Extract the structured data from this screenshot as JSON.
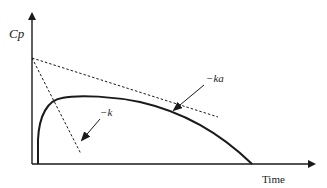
{
  "diagram": {
    "type": "pharmacokinetic concentration-time curve",
    "y_axis_label": "Cp",
    "x_axis_label": "Time",
    "annotations": [
      {
        "id": "ka",
        "label": "−ka",
        "points_to": "terminal elimination slope of curve"
      },
      {
        "id": "k",
        "label": "−k",
        "points_to": "steep dashed line"
      }
    ],
    "lines": [
      {
        "id": "curve",
        "style": "solid",
        "description": "rise then decay concentration curve"
      },
      {
        "id": "dashed-shallow",
        "style": "dashed",
        "description": "extrapolated terminal line from y-intercept"
      },
      {
        "id": "dashed-steep",
        "style": "dashed",
        "description": "steep residual line from y-intercept"
      }
    ],
    "colors": {
      "stroke": "#1a1a1a",
      "text": "#222222",
      "background": "#ffffff"
    }
  }
}
